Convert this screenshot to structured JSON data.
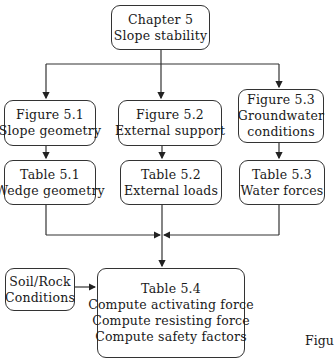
{
  "diagram": {
    "root": {
      "lines": [
        "Chapter 5",
        "Slope stability"
      ]
    },
    "figures": [
      {
        "lines": [
          "Figure 5.1",
          "Slope geometry"
        ]
      },
      {
        "lines": [
          "Figure 5.2",
          "External support"
        ]
      },
      {
        "lines": [
          "Figure 5.3",
          "Groundwater",
          "conditions"
        ]
      }
    ],
    "tables": [
      {
        "lines": [
          "Table 5.1",
          "Wedge geometry"
        ]
      },
      {
        "lines": [
          "Table 5.2",
          "External loads"
        ]
      },
      {
        "lines": [
          "Table 5.3",
          "Water forces"
        ]
      }
    ],
    "input": {
      "lines": [
        "Soil/Rock",
        "Conditions"
      ]
    },
    "final": {
      "lines": [
        "Table 5.4",
        "Compute activating force",
        "Compute resisting force",
        "Compute safety factors"
      ]
    },
    "caption_partial": "Figu",
    "line_color": "#333333"
  }
}
